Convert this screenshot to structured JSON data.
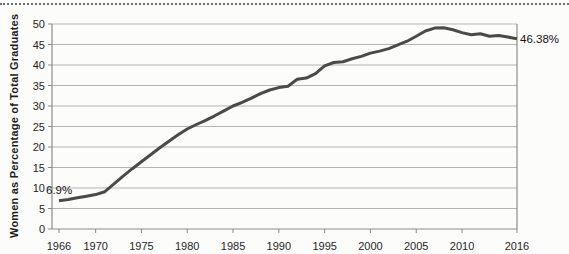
{
  "figure": {
    "background": "#fcfcfb",
    "top_rule_style": "dotted"
  },
  "chart_data": {
    "type": "line",
    "title": "",
    "xlabel": "",
    "ylabel": "Women as Percentage of Total Graduates",
    "ylim": [
      0,
      50
    ],
    "ytick_step": 5,
    "yticks": [
      0,
      5,
      10,
      15,
      20,
      25,
      30,
      35,
      40,
      45,
      50
    ],
    "xticks": [
      1966,
      1970,
      1975,
      1980,
      1985,
      1990,
      1995,
      2000,
      2005,
      2010,
      2016
    ],
    "xlim": [
      1966,
      2016
    ],
    "grid": true,
    "legend": "none",
    "line_color": "#4a4a4a",
    "grid_color": "#b5b5b5",
    "axis_color": "#8c8c8c",
    "series": [
      {
        "name": "Women as Percentage of Total Graduates",
        "x": [
          1966,
          1967,
          1968,
          1969,
          1970,
          1971,
          1972,
          1973,
          1974,
          1975,
          1976,
          1977,
          1978,
          1979,
          1980,
          1981,
          1982,
          1983,
          1984,
          1985,
          1986,
          1987,
          1988,
          1989,
          1990,
          1991,
          1992,
          1993,
          1994,
          1995,
          1996,
          1997,
          1998,
          1999,
          2000,
          2001,
          2002,
          2003,
          2004,
          2005,
          2006,
          2007,
          2008,
          2009,
          2010,
          2011,
          2012,
          2013,
          2014,
          2015,
          2016
        ],
        "values": [
          6.9,
          7.2,
          7.6,
          8.0,
          8.4,
          9.1,
          11.0,
          12.9,
          14.7,
          16.4,
          18.1,
          19.8,
          21.4,
          23.0,
          24.4,
          25.5,
          26.5,
          27.6,
          28.8,
          30.0,
          30.9,
          31.9,
          33.0,
          33.9,
          34.5,
          34.8,
          36.5,
          36.8,
          37.9,
          39.8,
          40.6,
          40.8,
          41.5,
          42.1,
          42.9,
          43.4,
          44.0,
          44.9,
          45.8,
          47.0,
          48.3,
          49.0,
          49.1,
          48.6,
          47.9,
          47.4,
          47.6,
          47.0,
          47.2,
          46.8,
          46.38
        ]
      }
    ],
    "annotations": {
      "start": {
        "text": "6.9%",
        "x": 1966,
        "y": 6.9
      },
      "end": {
        "text": "46.38%",
        "x": 2016,
        "y": 46.38
      }
    }
  }
}
